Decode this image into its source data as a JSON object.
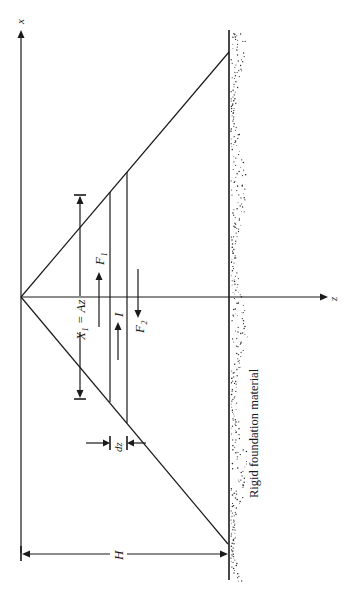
{
  "figure": {
    "orientation": "rotated-90-ccw",
    "axes": {
      "x_axis_label": "x",
      "z_axis_label": "z"
    },
    "labels": {
      "x1_equation": "X₁ = Az",
      "force_f1": "F₁",
      "force_f2": "F₂",
      "inertia": "I",
      "element_thickness": "dz",
      "height": "H",
      "foundation": "Rigid foundation material"
    },
    "colors": {
      "ink": "#1a1a1a",
      "background": "#ffffff"
    }
  }
}
